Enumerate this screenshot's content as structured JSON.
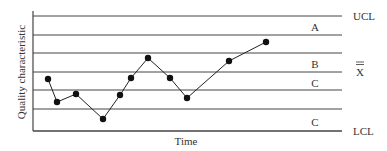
{
  "chart_data": {
    "type": "line",
    "title": "",
    "xlabel": "Time",
    "ylabel": "Quality characteristic",
    "grid": true,
    "legend": null,
    "control_lines": [
      {
        "label": "UCL",
        "y": 16
      },
      {
        "label": "",
        "y": 35
      },
      {
        "label": "",
        "y": 53
      },
      {
        "label": "X̄",
        "y": 72
      },
      {
        "label": "",
        "y": 90
      },
      {
        "label": "",
        "y": 109
      },
      {
        "label": "LCL",
        "y": 131
      }
    ],
    "zone_labels": [
      {
        "label": "A",
        "y": 27
      },
      {
        "label": "B",
        "y": 64
      },
      {
        "label": "C",
        "y": 83
      },
      {
        "label": "C",
        "y": 122
      }
    ],
    "points_px": [
      [
        48,
        79
      ],
      [
        57,
        102
      ],
      [
        76,
        94
      ],
      [
        103,
        119
      ],
      [
        120,
        95
      ],
      [
        131,
        78
      ],
      [
        148,
        58
      ],
      [
        170,
        78
      ],
      [
        187,
        98
      ],
      [
        229,
        61
      ],
      [
        266,
        42
      ]
    ],
    "colors": {
      "line": "#222222",
      "grid": "#444444",
      "text": "#333333"
    }
  },
  "labels": {
    "ucl": "UCL",
    "xbar": "X",
    "lcl": "LCL",
    "zone_a": "A",
    "zone_b": "B",
    "zone_c_upper": "C",
    "zone_c_lower": "C",
    "x_axis": "Time",
    "y_axis": "Quality characteristic"
  }
}
